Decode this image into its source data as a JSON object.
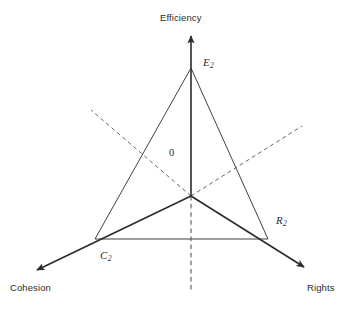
{
  "figure": {
    "type": "triangle-axes-diagram",
    "background_color": "#ffffff",
    "line_color": "#2b2b2b",
    "center_point": {
      "x": 191,
      "y": 196,
      "label": "0"
    },
    "axes": [
      {
        "id": "efficiency",
        "label": "Efficiency",
        "direction": "up",
        "arrow": true,
        "style": "solid",
        "from": {
          "x": 191,
          "y": 196
        },
        "to": {
          "x": 191,
          "y": 32
        }
      },
      {
        "id": "cohesion",
        "label": "Cohesion",
        "direction": "down-left",
        "arrow": true,
        "style": "solid",
        "from": {
          "x": 191,
          "y": 196
        },
        "to": {
          "x": 32,
          "y": 273
        }
      },
      {
        "id": "rights",
        "label": "Rights",
        "direction": "down-right",
        "arrow": true,
        "style": "solid",
        "from": {
          "x": 191,
          "y": 196
        },
        "to": {
          "x": 308,
          "y": 270
        }
      }
    ],
    "dashed_lines": [
      {
        "id": "dashed-upper-left",
        "style": "dashed",
        "from": {
          "x": 191,
          "y": 196
        },
        "to": {
          "x": 91,
          "y": 110
        }
      },
      {
        "id": "dashed-upper-right",
        "style": "dashed",
        "from": {
          "x": 191,
          "y": 196
        },
        "to": {
          "x": 302,
          "y": 126
        }
      },
      {
        "id": "dashed-lower-vertical",
        "style": "dashed",
        "from": {
          "x": 191,
          "y": 196
        },
        "to": {
          "x": 191,
          "y": 290
        }
      }
    ],
    "triangle": {
      "style": "solid",
      "vertices": [
        {
          "id": "E2",
          "label": "E",
          "subscript": "2",
          "x": 191,
          "y": 68
        },
        {
          "id": "C2",
          "label": "C",
          "subscript": "2",
          "x": 95,
          "y": 239
        },
        {
          "id": "R2",
          "label": "R",
          "subscript": "2",
          "x": 268,
          "y": 239
        }
      ],
      "edges": [
        {
          "from": "E2",
          "to": "C2"
        },
        {
          "from": "E2",
          "to": "R2"
        },
        {
          "from": "C2",
          "to": "R2"
        }
      ]
    }
  },
  "labels": {
    "efficiency": "Efficiency",
    "cohesion": "Cohesion",
    "rights": "Rights",
    "origin": "0",
    "e2_base": "E",
    "e2_sub": "2",
    "c2_base": "C",
    "c2_sub": "2",
    "r2_base": "R",
    "r2_sub": "2"
  }
}
